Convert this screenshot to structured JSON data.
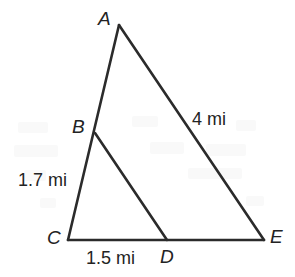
{
  "figure": {
    "kind": "geometry-diagram",
    "background_color": "#ffffff",
    "line_color": "#2b2b2b",
    "label_color": "#232323",
    "width": 295,
    "height": 277,
    "vertices": [
      {
        "id": "A",
        "label": "A",
        "x": 119,
        "y": 25,
        "label_x": 98,
        "label_y": 9
      },
      {
        "id": "B",
        "label": "B",
        "x": 95,
        "y": 133,
        "label_x": 72,
        "label_y": 117
      },
      {
        "id": "C",
        "label": "C",
        "x": 68,
        "y": 240,
        "label_x": 47,
        "label_y": 228
      },
      {
        "id": "D",
        "label": "D",
        "x": 167,
        "y": 240,
        "label_x": 160,
        "label_y": 247
      },
      {
        "id": "E",
        "label": "E",
        "x": 264,
        "y": 240,
        "label_x": 270,
        "label_y": 227
      }
    ],
    "segments": [
      {
        "id": "AC",
        "from": "A",
        "to": "C",
        "note": "passes through B"
      },
      {
        "id": "AE",
        "from": "A",
        "to": "E"
      },
      {
        "id": "CE",
        "from": "C",
        "to": "E",
        "note": "passes through D"
      },
      {
        "id": "BD",
        "from": "B",
        "to": "D"
      }
    ],
    "measurements": [
      {
        "id": "side-ae",
        "segment": "AE",
        "text": "4 mi",
        "value": 4,
        "unit": "mi",
        "label_x": 192,
        "label_y": 110
      },
      {
        "id": "side-bc",
        "segment": "BC",
        "text": "1.7 mi",
        "value": 1.7,
        "unit": "mi",
        "label_x": 18,
        "label_y": 171
      },
      {
        "id": "side-cd",
        "segment": "CD",
        "text": "1.5 mi",
        "value": 1.5,
        "unit": "mi",
        "label_x": 86,
        "label_y": 249
      }
    ]
  }
}
